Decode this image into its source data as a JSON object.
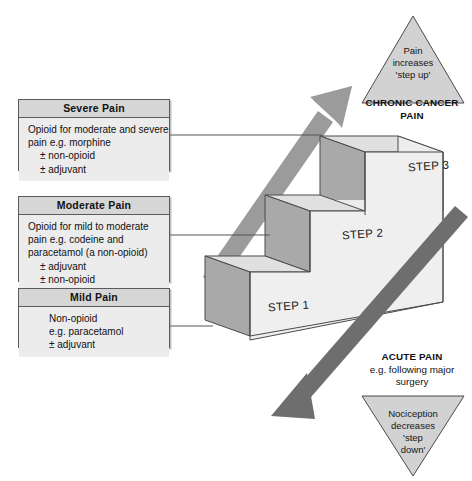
{
  "figure": {
    "colors": {
      "box_fill": "#ececec",
      "box_header_fill": "#d6d6d6",
      "box_border": "#5a5a5a",
      "step_top_fill": "#e3e3e3",
      "step_front_fill": "#ededed",
      "step_riser_fill": "#a9a9a9",
      "arrow_up": "#9b9b9b",
      "arrow_down": "#6e6e6e",
      "triangle_fill": "#d2d2d2",
      "outline": "#4a4a4a",
      "connector": "#555555"
    }
  },
  "boxes": [
    {
      "id": "severe",
      "header": "Severe Pain",
      "lines": [
        "Opioid for moderate and severe",
        "pain e.g. morphine"
      ],
      "indented": [
        "± non-opioid",
        "± adjuvant"
      ]
    },
    {
      "id": "moderate",
      "header": "Moderate Pain",
      "lines": [
        "Opioid for mild to moderate",
        "pain e.g. codeine and",
        "paracetamol (a non-opioid)"
      ],
      "indented": [
        "± adjuvant",
        "± non-opioid"
      ]
    },
    {
      "id": "mild",
      "header": "Mild Pain",
      "lines": [
        "Non-opioid",
        "e.g. paracetamol",
        "± adjuvant"
      ],
      "indented": []
    }
  ],
  "steps": [
    {
      "id": "step1",
      "label": "STEP 1"
    },
    {
      "id": "step2",
      "label": "STEP 2"
    },
    {
      "id": "step3",
      "label": "STEP 3"
    }
  ],
  "triangles": {
    "top": {
      "lines": [
        "Pain",
        "increases",
        "'step up'"
      ],
      "caption": [
        "CHRONIC CANCER",
        "PAIN"
      ]
    },
    "bottom": {
      "lines": [
        "Nociception",
        "decreases",
        "'step",
        "down'"
      ],
      "caption_bold": "ACUTE PAIN",
      "caption_rest": [
        "e.g. following major",
        "surgery"
      ]
    }
  },
  "arrows": {
    "up": {
      "name": "step-up-arrow",
      "direction": "up-right"
    },
    "down": {
      "name": "step-down-arrow",
      "direction": "down-left"
    }
  }
}
